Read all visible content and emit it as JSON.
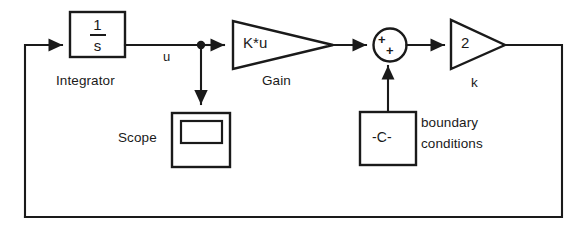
{
  "diagram": {
    "type": "control-system-block-diagram",
    "stroke_color": "#1a1a1a",
    "background_color": "#ffffff"
  },
  "blocks": {
    "integrator": {
      "name_label": "Integrator",
      "numerator": "1",
      "denominator": "s",
      "shape": "rectangle"
    },
    "gain": {
      "name_label": "Gain",
      "value_label": "K*u",
      "shape": "triangle"
    },
    "sum": {
      "name_label": "",
      "sign_top": "+",
      "sign_bottom": "+",
      "shape": "circle"
    },
    "output_gain": {
      "name_label": "k",
      "value_label": "2",
      "shape": "triangle"
    },
    "scope": {
      "name_label": "Scope",
      "shape": "scope-box"
    },
    "constant": {
      "value_label": "-C-",
      "name_label_line1": "boundary",
      "name_label_line2": "conditions",
      "shape": "rectangle"
    }
  },
  "signals": {
    "integrator_output": "u"
  }
}
